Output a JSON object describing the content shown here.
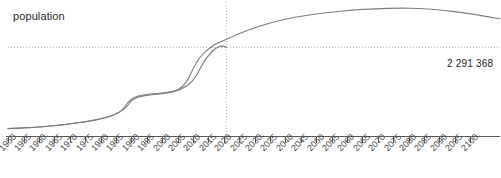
{
  "chart_data": {
    "type": "line",
    "title": "",
    "ylabel": "population",
    "xlabel": "",
    "grid": false,
    "legend": "none",
    "xlim": [
      1950,
      2100
    ],
    "ylim": [
      0,
      4200000
    ],
    "x": [
      1950,
      1955,
      1960,
      1965,
      1970,
      1975,
      1980,
      1985,
      1990,
      1995,
      2000,
      2005,
      2010,
      2015,
      2020,
      2023,
      2025,
      2030,
      2035,
      2040,
      2045,
      2050,
      2055,
      2060,
      2065,
      2070,
      2075,
      2080,
      2085,
      2090,
      2095,
      2100
    ],
    "values": [
      260000,
      275000,
      295000,
      320000,
      350000,
      390000,
      440000,
      520000,
      690000,
      760000,
      860000,
      1050000,
      1480000,
      1880000,
      2180000,
      2291368,
      2360000,
      2580000,
      2790000,
      2990000,
      3170000,
      3330000,
      3470000,
      3590000,
      3680000,
      3745000,
      3780000,
      3780000,
      3750000,
      3700000,
      3640000,
      3580000
    ],
    "tick_labels": [
      "1950",
      "1955",
      "1960",
      "1965",
      "1970",
      "1975",
      "1980",
      "1985",
      "1990",
      "1995",
      "2000",
      "2005",
      "2010",
      "2015",
      "2020",
      "2025",
      "2030",
      "2035",
      "2040",
      "2045",
      "2050",
      "2055",
      "2060",
      "2065",
      "2070",
      "2075",
      "2080",
      "2085",
      "2090",
      "2095",
      "2100"
    ],
    "annotation": {
      "value_text": "2 291 368",
      "marker_year": 2023,
      "marker_value": 2291368
    },
    "line_color": "#7d7d7d",
    "guide_color": "#b9b9b9",
    "axis_color": "#555555",
    "text_color": "#2a2a2a"
  }
}
